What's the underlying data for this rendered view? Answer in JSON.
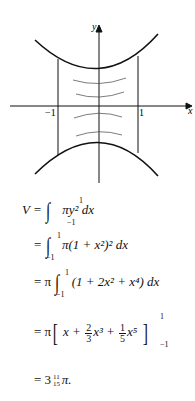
{
  "figure": {
    "x_axis_label": "x",
    "y_axis_label": "y",
    "tick_neg": "−1",
    "tick_pos": "1"
  },
  "equations": {
    "line1": {
      "lhs": "V =",
      "upper": "1",
      "lower": "−1",
      "body": "πy² dx"
    },
    "line2": {
      "lhs": "=",
      "upper": "1",
      "lower": "−1",
      "body": "π(1 + x²)² dx"
    },
    "line3": {
      "lhs": "= π",
      "upper": "1",
      "lower": "−1",
      "body": "(1 + 2x² + x⁴) dx"
    },
    "line4": {
      "lhs": "= π",
      "pre": "x +",
      "frac1_num": "2",
      "frac1_den": "3",
      "mid": "x³ +",
      "frac2_num": "1",
      "frac2_den": "5",
      "post": "x⁵",
      "upper": "1",
      "lower": "−1"
    },
    "line5": {
      "lhs": "= 3",
      "frac_num": "11",
      "frac_den": "15",
      "post": "π."
    }
  }
}
